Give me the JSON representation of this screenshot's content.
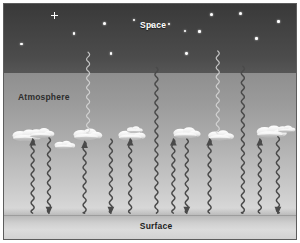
{
  "figure": {
    "width": 300,
    "height": 243,
    "border_color": "#5d5d5d",
    "background": "#ffffff"
  },
  "labels": {
    "space": "Space",
    "atmosphere": "Atmosphere",
    "surface": "Surface"
  },
  "bands": [
    {
      "name": "space",
      "label": "Space",
      "top_pct": 0,
      "height_pct": 29.4,
      "color_top": "#393939",
      "color_bottom": "#565656"
    },
    {
      "name": "atmosphere",
      "label": "Atmosphere",
      "top_pct": 29.4,
      "height_pct": 60.2,
      "color_top": "#8f8f8f",
      "color_bottom": "#dcdcdc"
    },
    {
      "name": "surface",
      "label": "Surface",
      "top_pct": 89.6,
      "height_pct": 10.4,
      "color_top": "#b9b9b9",
      "color_bottom": "#d2d2d2"
    }
  ],
  "stars": [
    {
      "x_pct": 17.2,
      "y_pct": 5.1,
      "size": 3.4,
      "shape": "cross"
    },
    {
      "x_pct": 6.0,
      "y_pct": 17.0,
      "size": 2.6,
      "shape": "dot"
    },
    {
      "x_pct": 24.0,
      "y_pct": 12.4,
      "size": 2.8,
      "shape": "dot"
    },
    {
      "x_pct": 34.5,
      "y_pct": 8.2,
      "size": 3.0,
      "shape": "dot"
    },
    {
      "x_pct": 36.6,
      "y_pct": 21.0,
      "size": 2.6,
      "shape": "dot"
    },
    {
      "x_pct": 56.5,
      "y_pct": 8.6,
      "size": 2.2,
      "shape": "dot"
    },
    {
      "x_pct": 62.0,
      "y_pct": 11.5,
      "size": 2.6,
      "shape": "dot"
    },
    {
      "x_pct": 62.5,
      "y_pct": 21.0,
      "size": 2.8,
      "shape": "dot"
    },
    {
      "x_pct": 67.0,
      "y_pct": 11.8,
      "size": 2.6,
      "shape": "dot"
    },
    {
      "x_pct": 71.2,
      "y_pct": 4.5,
      "size": 3.0,
      "shape": "dot"
    },
    {
      "x_pct": 81.0,
      "y_pct": 4.0,
      "size": 3.2,
      "shape": "dot"
    },
    {
      "x_pct": 86.5,
      "y_pct": 14.8,
      "size": 2.6,
      "shape": "dot"
    },
    {
      "x_pct": 94.0,
      "y_pct": 7.4,
      "size": 2.4,
      "shape": "dot"
    },
    {
      "x_pct": 44.4,
      "y_pct": 7.0,
      "size": 2.0,
      "shape": "dot"
    },
    {
      "x_pct": 50.8,
      "y_pct": 9.0,
      "size": 1.8,
      "shape": "dot"
    }
  ],
  "clouds": [
    {
      "id": "cloud-1",
      "x_pct": 7.5,
      "y_pct": 55.5,
      "scale": 1.0
    },
    {
      "id": "cloud-2",
      "x_pct": 12.8,
      "y_pct": 54.0,
      "scale": 0.85
    },
    {
      "id": "cloud-3",
      "x_pct": 20.8,
      "y_pct": 58.5,
      "scale": 0.72
    },
    {
      "id": "cloud-4",
      "x_pct": 28.5,
      "y_pct": 55.0,
      "scale": 1.0
    },
    {
      "id": "cloud-5",
      "x_pct": 43.5,
      "y_pct": 55.5,
      "scale": 0.95
    },
    {
      "id": "cloud-6",
      "x_pct": 44.8,
      "y_pct": 51.0,
      "scale": 0.55
    },
    {
      "id": "cloud-7",
      "x_pct": 62.5,
      "y_pct": 54.5,
      "scale": 0.95
    },
    {
      "id": "cloud-8",
      "x_pct": 74.0,
      "y_pct": 55.5,
      "scale": 0.9
    },
    {
      "id": "cloud-9",
      "x_pct": 91.5,
      "y_pct": 54.0,
      "scale": 1.05
    },
    {
      "id": "cloud-10",
      "x_pct": 96.5,
      "y_pct": 51.0,
      "scale": 0.6
    }
  ],
  "rays": [
    {
      "id": "ray-up-space-1",
      "x_pct": 28.8,
      "y_top_pct": 20.5,
      "y_bottom_pct": 55.0,
      "direction": "up",
      "tone": "light",
      "arrow": false
    },
    {
      "id": "ray-up-space-2",
      "x_pct": 73.2,
      "y_top_pct": 20.0,
      "y_bottom_pct": 55.0,
      "direction": "up",
      "tone": "light",
      "arrow": false
    },
    {
      "id": "ray-escape-1",
      "x_pct": 52.2,
      "y_top_pct": 27.0,
      "y_bottom_pct": 89.0,
      "direction": "up",
      "tone": "dark",
      "arrow": false
    },
    {
      "id": "ray-escape-2",
      "x_pct": 81.8,
      "y_top_pct": 26.5,
      "y_bottom_pct": 89.0,
      "direction": "up",
      "tone": "dark",
      "arrow": false
    },
    {
      "id": "ray-up-1",
      "x_pct": 9.8,
      "y_top_pct": 57.5,
      "y_bottom_pct": 89.0,
      "direction": "up",
      "tone": "dark",
      "arrow": true
    },
    {
      "id": "ray-down-1",
      "x_pct": 15.4,
      "y_top_pct": 57.0,
      "y_bottom_pct": 89.0,
      "direction": "down",
      "tone": "dark",
      "arrow": true
    },
    {
      "id": "ray-up-2",
      "x_pct": 27.6,
      "y_top_pct": 58.5,
      "y_bottom_pct": 89.0,
      "direction": "up",
      "tone": "dark",
      "arrow": true
    },
    {
      "id": "ray-down-2",
      "x_pct": 36.6,
      "y_top_pct": 57.5,
      "y_bottom_pct": 89.0,
      "direction": "down",
      "tone": "dark",
      "arrow": true
    },
    {
      "id": "ray-up-3",
      "x_pct": 43.2,
      "y_top_pct": 57.5,
      "y_bottom_pct": 89.0,
      "direction": "up",
      "tone": "dark",
      "arrow": true
    },
    {
      "id": "ray-up-4",
      "x_pct": 58.0,
      "y_top_pct": 57.5,
      "y_bottom_pct": 89.0,
      "direction": "up",
      "tone": "dark",
      "arrow": true
    },
    {
      "id": "ray-down-3",
      "x_pct": 62.6,
      "y_top_pct": 57.5,
      "y_bottom_pct": 89.0,
      "direction": "down",
      "tone": "dark",
      "arrow": true
    },
    {
      "id": "ray-up-5",
      "x_pct": 70.4,
      "y_top_pct": 57.5,
      "y_bottom_pct": 89.0,
      "direction": "up",
      "tone": "dark",
      "arrow": true
    },
    {
      "id": "ray-up-6",
      "x_pct": 87.6,
      "y_top_pct": 57.5,
      "y_bottom_pct": 89.0,
      "direction": "up",
      "tone": "dark",
      "arrow": true
    },
    {
      "id": "ray-down-4",
      "x_pct": 93.8,
      "y_top_pct": 56.5,
      "y_bottom_pct": 89.0,
      "direction": "down",
      "tone": "dark",
      "arrow": true
    }
  ],
  "colors": {
    "space_dark": "#393939",
    "space_light": "#565656",
    "atmosphere_top": "#8f8f8f",
    "atmosphere_bottom": "#dcdcdc",
    "surface": "#d2d2d2",
    "ray_dark": "#4a4a4a",
    "ray_light": "#d8d8d8",
    "star": "#ffffff",
    "text_light": "#ffffff",
    "text_dark": "#1d1d1d"
  }
}
